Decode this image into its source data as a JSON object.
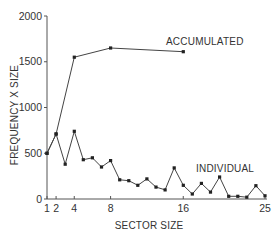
{
  "chart_data": {
    "type": "line",
    "title": "",
    "xlabel": "SECTOR SIZE",
    "ylabel": "FREQUENCY X SIZE",
    "xlim": [
      1,
      25
    ],
    "ylim": [
      0,
      2000
    ],
    "x_ticks": [
      1,
      2,
      4,
      8,
      16,
      25
    ],
    "y_ticks": [
      0,
      500,
      1000,
      1500,
      2000
    ],
    "grid": false,
    "legend": "inline labels",
    "series": [
      {
        "name": "ACCUMULATED",
        "x": [
          1,
          2,
          4,
          8,
          16
        ],
        "values": [
          500,
          710,
          1550,
          1650,
          1610
        ],
        "label_pos": [
          166,
          41
        ]
      },
      {
        "name": "INDIVIDUAL",
        "x": [
          1,
          2,
          3,
          4,
          5,
          6,
          7,
          8,
          9,
          10,
          11,
          12,
          13,
          14,
          15,
          16,
          17,
          18,
          19,
          20,
          21,
          22,
          23,
          24,
          25
        ],
        "values": [
          500,
          710,
          380,
          740,
          430,
          450,
          350,
          420,
          210,
          200,
          150,
          220,
          130,
          100,
          340,
          150,
          55,
          170,
          75,
          240,
          30,
          30,
          20,
          145,
          35
        ],
        "label_pos": [
          196,
          168
        ]
      }
    ],
    "colors": {
      "line": "#444444",
      "marker": "#222222",
      "axis": "#555555",
      "text": "#333333"
    }
  }
}
